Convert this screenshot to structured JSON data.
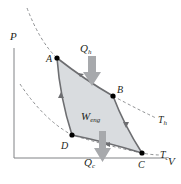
{
  "diagram": {
    "axes": {
      "y_label": "P",
      "x_label": "V"
    },
    "points": [
      {
        "id": "A",
        "label": "A",
        "x": 57,
        "y": 58
      },
      {
        "id": "B",
        "label": "B",
        "x": 113,
        "y": 96
      },
      {
        "id": "C",
        "label": "C",
        "x": 142,
        "y": 153
      },
      {
        "id": "D",
        "label": "D",
        "x": 72,
        "y": 135
      }
    ],
    "isotherms": [
      {
        "id": "hot",
        "label_main": "T",
        "label_sub": "h"
      },
      {
        "id": "cold",
        "label_main": "T",
        "label_sub": "c"
      }
    ],
    "heat_in": {
      "label_main": "Q",
      "label_sub": "h"
    },
    "heat_out": {
      "label_main": "Q",
      "label_sub": "c"
    },
    "work": {
      "label_main": "W",
      "label_sub": "eng"
    },
    "colors": {
      "region_fill": "#d9dcdf",
      "cycle_line": "#6d6e71",
      "arrow_fill": "#a7a9ac",
      "dashed": "#808285",
      "axis": "#808285",
      "point": "#000000",
      "text": "#231f20"
    }
  }
}
